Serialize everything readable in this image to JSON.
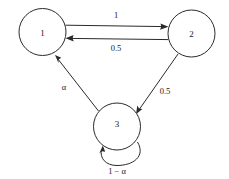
{
  "diagram": {
    "type": "state-transition-diagram",
    "title": "",
    "background_color": "#ffffff",
    "stroke_color": "#2a2a2a",
    "text_color": "#1a1a1a",
    "nodes": [
      {
        "id": "1",
        "label": "1",
        "cx": 42.5,
        "cy": 32,
        "r": 23.5
      },
      {
        "id": "2",
        "label": "2",
        "cx": 191.5,
        "cy": 33.5,
        "r": 23.5
      },
      {
        "id": "3",
        "label": "3",
        "cx": 117,
        "cy": 126.5,
        "r": 23.5
      }
    ],
    "edges": [
      {
        "id": "e1to2",
        "from": "1",
        "to": "2",
        "label": "1",
        "label_x": 116,
        "label_y": 15
      },
      {
        "id": "e2to1",
        "from": "2",
        "to": "1",
        "label": "0.5",
        "label_x": 116,
        "label_y": 48
      },
      {
        "id": "e2to3",
        "from": "2",
        "to": "3",
        "label": "0.5",
        "label_x": 165,
        "label_y": 91
      },
      {
        "id": "e3to1",
        "from": "3",
        "to": "1",
        "label": "α",
        "label_x": 64,
        "label_y": 87
      },
      {
        "id": "e3to3",
        "from": "3",
        "to": "3",
        "label": "1 − α",
        "label_x": 117,
        "label_y": 171
      }
    ]
  }
}
